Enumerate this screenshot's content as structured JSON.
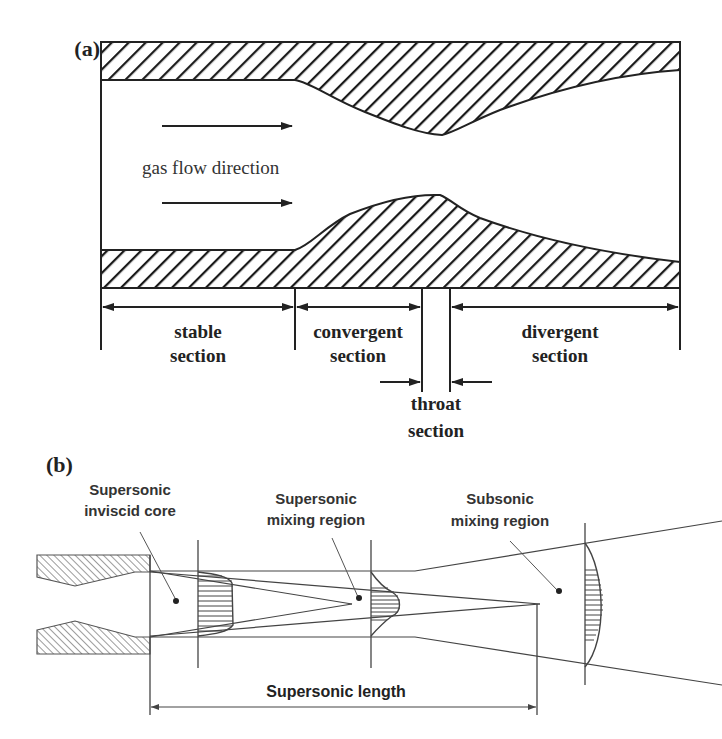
{
  "panel_a": {
    "label": "(a)",
    "flow_label": "gas flow direction",
    "sections": {
      "stable": [
        "stable",
        "section"
      ],
      "convergent": [
        "convergent",
        "section"
      ],
      "throat": [
        "throat",
        "section"
      ],
      "divergent": [
        "divergent",
        "section"
      ]
    }
  },
  "panel_b": {
    "label": "(b)",
    "regions": {
      "inviscid_core": [
        "Supersonic",
        "inviscid core"
      ],
      "supersonic_mixing": [
        "Supersonic",
        "mixing region"
      ],
      "subsonic_mixing": [
        "Subsonic",
        "mixing region"
      ]
    },
    "dimension_label": "Supersonic length"
  },
  "colors": {
    "line": "#222222",
    "hatch_a": "#1a1a1a",
    "hatch_b": "#555555",
    "background": "#ffffff"
  }
}
